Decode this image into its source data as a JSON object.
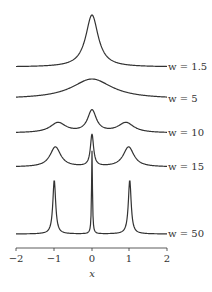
{
  "chart_data": {
    "type": "line",
    "title": "",
    "xlabel": "x",
    "ylabel": "",
    "xlim": [
      -2,
      2
    ],
    "x_ticks": [
      "-2",
      "-1",
      "0",
      "1",
      "2"
    ],
    "grid": false,
    "legend_position": "right (inline labels)",
    "series": [
      {
        "name": "w = 1.5",
        "label": "w = 1.5",
        "shape": "single sharp peak at x=0",
        "peaks": [
          0
        ]
      },
      {
        "name": "w = 5",
        "label": "w = 5",
        "shape": "single broad low peak at x=0",
        "peaks": [
          0
        ]
      },
      {
        "name": "w = 10",
        "label": "w = 10",
        "shape": "central peak at 0 with shoulders at ±1",
        "peaks": [
          -1,
          0,
          1
        ]
      },
      {
        "name": "w = 15",
        "label": "w = 15",
        "shape": "three peaks at -1, 0, 1; center tallest",
        "peaks": [
          -1,
          0,
          1
        ]
      },
      {
        "name": "w = 50",
        "label": "w = 50",
        "shape": "three sharp peaks at -1, 0, 1",
        "peaks": [
          -1,
          0,
          1
        ]
      }
    ]
  },
  "labels": {
    "s1": "w = 1.5",
    "s2": "w = 5",
    "s3": "w = 10",
    "s4": "w = 15",
    "s5": "w = 50",
    "xlabel": "x",
    "t0": "−2",
    "t1": "−1",
    "t2": "0",
    "t3": "1",
    "t4": "2"
  }
}
